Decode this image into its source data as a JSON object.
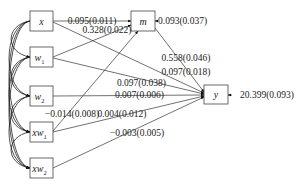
{
  "diagram": {
    "type": "path-diagram",
    "nodes": [
      {
        "id": "x",
        "base": "x",
        "sub": ""
      },
      {
        "id": "w1",
        "base": "w",
        "sub": "1"
      },
      {
        "id": "w2",
        "base": "w",
        "sub": "2"
      },
      {
        "id": "xw1",
        "base": "xw",
        "sub": "1"
      },
      {
        "id": "xw2",
        "base": "xw",
        "sub": "2"
      },
      {
        "id": "m",
        "base": "m",
        "sub": ""
      },
      {
        "id": "y",
        "base": "y",
        "sub": ""
      }
    ],
    "edges": [
      {
        "from": "x",
        "to": "m",
        "label": "0.095(0.011)"
      },
      {
        "from": "w1",
        "to": "m",
        "label": "0.328(0.022)"
      },
      {
        "from": "m",
        "to": "y",
        "label": "0.558(0.046)"
      },
      {
        "from": "x",
        "to": "y",
        "label": "0.097(0.018)"
      },
      {
        "from": "w1",
        "to": "y",
        "label": "0.097(0.038)"
      },
      {
        "from": "w2",
        "to": "y",
        "label": "0.007(0.006)"
      },
      {
        "from": "xw1",
        "to": "m",
        "label": "-0.014(0.008)"
      },
      {
        "from": "xw1",
        "to": "y",
        "label": "0.004(0.012)"
      },
      {
        "from": "xw2",
        "to": "y",
        "label": "-0.003(0.005)"
      }
    ],
    "residuals": [
      {
        "node": "m",
        "label": "0.093(0.037)"
      },
      {
        "node": "y",
        "label": "20.399(0.093)"
      }
    ],
    "covariances": "all exogenous variables (x, w1, w2, xw1, xw2) mutually correlated"
  }
}
